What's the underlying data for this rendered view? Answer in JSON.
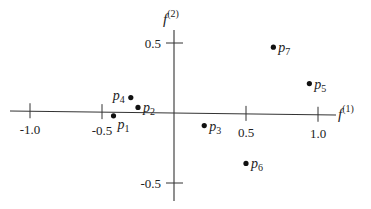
{
  "chart_data": {
    "type": "scatter",
    "title": "",
    "xlabel": "f(1)",
    "ylabel": "f(2)",
    "x_axis": {
      "symbol": "f",
      "superscript": "(1)"
    },
    "y_axis": {
      "symbol": "f",
      "superscript": "(2)"
    },
    "xlim": [
      -1.2,
      1.1
    ],
    "ylim": [
      -0.65,
      0.62
    ],
    "x_ticks": [
      {
        "value": -1.0,
        "label": "-1.0"
      },
      {
        "value": -0.5,
        "label": "-0.5"
      },
      {
        "value": 0.5,
        "label": "0.5"
      },
      {
        "value": 1.0,
        "label": "1.0"
      }
    ],
    "y_ticks": [
      {
        "value": 0.5,
        "label": "0.5"
      },
      {
        "value": -0.5,
        "label": "-0.5"
      }
    ],
    "grid": false,
    "legend": null,
    "points": [
      {
        "name": "p",
        "index": "1",
        "x": -0.42,
        "y": -0.02,
        "label_pos": "below-right"
      },
      {
        "name": "p",
        "index": "2",
        "x": -0.25,
        "y": 0.04,
        "label_pos": "right"
      },
      {
        "name": "p",
        "index": "3",
        "x": 0.21,
        "y": -0.09,
        "label_pos": "right"
      },
      {
        "name": "p",
        "index": "4",
        "x": -0.3,
        "y": 0.11,
        "label_pos": "left"
      },
      {
        "name": "p",
        "index": "5",
        "x": 0.94,
        "y": 0.21,
        "label_pos": "right"
      },
      {
        "name": "p",
        "index": "6",
        "x": 0.5,
        "y": -0.36,
        "label_pos": "right"
      },
      {
        "name": "p",
        "index": "7",
        "x": 0.69,
        "y": 0.47,
        "label_pos": "right"
      }
    ]
  },
  "colors": {
    "axis": "#333333",
    "point": "#111111",
    "text": "#222222",
    "background": "#ffffff"
  }
}
